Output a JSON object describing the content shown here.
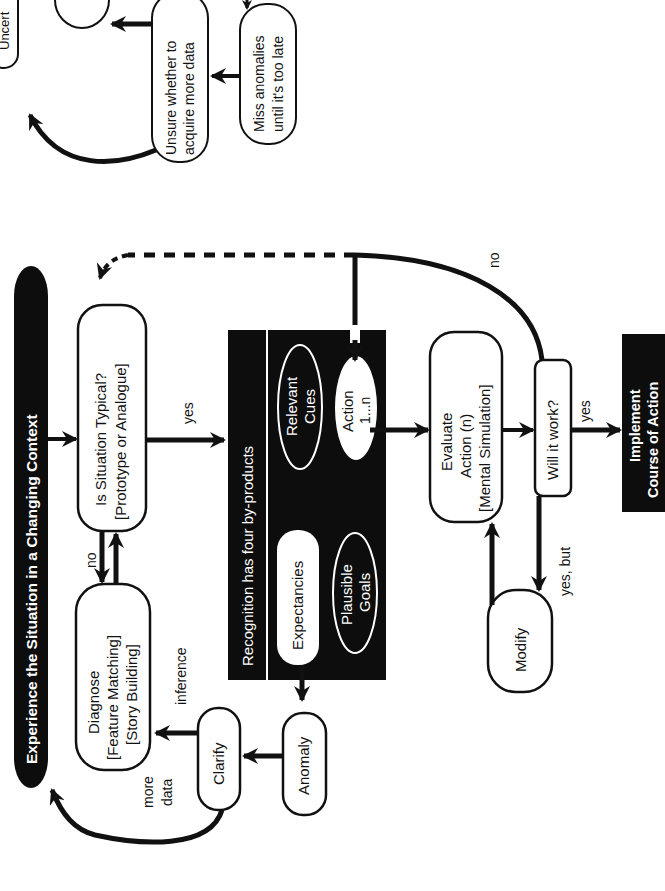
{
  "diagram": {
    "orientation": "rotated -90deg (reads bottom-to-top)",
    "title": "Experience the Situation in a Changing Context",
    "nodes": {
      "typical": {
        "line1": "Is Situation Typical?",
        "line2": "[Prototype or Analogue]"
      },
      "diagnose": {
        "line1": "Diagnose",
        "line2": "[Feature Matching]",
        "line3": "[Story Building]"
      },
      "recognition": {
        "title": "Recognition has four by-products",
        "expectancies": "Expectancies",
        "plausible_goals": {
          "line1": "Plausible",
          "line2": "Goals"
        },
        "relevant_cues": {
          "line1": "Relevant",
          "line2": "Cues"
        },
        "action": {
          "line1": "Action",
          "line2": "1...n"
        }
      },
      "evaluate": {
        "line1": "Evaluate",
        "line2": "Action (n)",
        "line3": "[Mental Simulation]"
      },
      "will_it_work": "Will it work?",
      "modify": "Modify",
      "implement": {
        "line1": "Implement",
        "line2": "Course of Action"
      },
      "anomaly": "Anomaly",
      "clarify": "Clarify",
      "unsure": {
        "line1": "Unsure whether to",
        "line2": "acquire more data"
      },
      "miss_anomalies": {
        "line1": "Miss anomalies",
        "line2": "until it's too late"
      },
      "uncertain_partial": "Uncert"
    },
    "edge_labels": {
      "no_typical": "no",
      "yes_typical": "yes",
      "no_will": "no",
      "yes_will": "yes",
      "yes_but": "yes, but",
      "inference": "inference",
      "more_data_1": "more",
      "more_data_2": "data"
    }
  }
}
